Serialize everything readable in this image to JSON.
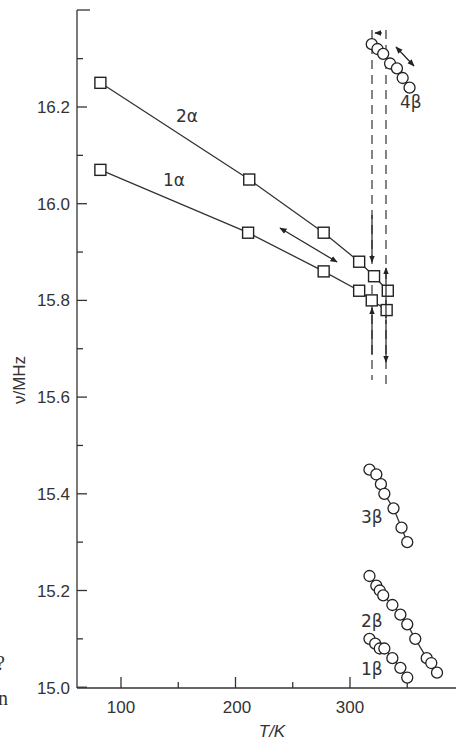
{
  "chart_data": {
    "type": "scatter",
    "title": "",
    "xlabel": "T/K",
    "ylabel": "ν/MHz",
    "xlim": [
      62,
      410
    ],
    "ylim": [
      15.0,
      16.4
    ],
    "x_ticks": [
      100,
      200,
      300
    ],
    "x_minor_ticks": [
      150,
      250,
      350
    ],
    "y_ticks": [
      15.0,
      15.2,
      15.4,
      15.6,
      15.8,
      16.0,
      16.2
    ],
    "y_tick_labels": [
      "15.0",
      "15.2",
      "15.4",
      "15.6",
      "15.8",
      "16.0",
      "16.2"
    ],
    "y_minor_ticks": [
      15.1,
      15.3,
      15.5,
      15.7,
      15.9,
      16.1,
      16.3
    ],
    "x_tick_labels": [
      "100",
      "200",
      "300"
    ],
    "grid": false,
    "legend": "inline labels",
    "series": [
      {
        "name": "2α",
        "marker": "square",
        "connected": true,
        "x": [
          82,
          212,
          277,
          308,
          321,
          333
        ],
        "y": [
          16.25,
          16.05,
          15.94,
          15.88,
          15.85,
          15.82
        ]
      },
      {
        "name": "1α",
        "marker": "square",
        "connected": true,
        "x": [
          82,
          211,
          277,
          308,
          319,
          332
        ],
        "y": [
          16.07,
          15.94,
          15.86,
          15.82,
          15.8,
          15.78
        ]
      },
      {
        "name": "4β",
        "marker": "circle",
        "connected": true,
        "x": [
          319,
          324,
          329,
          335,
          341,
          346,
          352
        ],
        "y": [
          16.33,
          16.32,
          16.31,
          16.29,
          16.28,
          16.26,
          16.24
        ]
      },
      {
        "name": "3β",
        "marker": "circle",
        "connected": true,
        "x": [
          317,
          323,
          327,
          330,
          338,
          345,
          350
        ],
        "y": [
          15.45,
          15.44,
          15.42,
          15.4,
          15.37,
          15.33,
          15.3
        ]
      },
      {
        "name": "2β",
        "marker": "circle",
        "connected": true,
        "x": [
          317,
          323,
          326,
          329,
          337,
          344,
          350,
          357,
          367,
          371,
          376
        ],
        "y": [
          15.23,
          15.21,
          15.2,
          15.19,
          15.17,
          15.15,
          15.13,
          15.1,
          15.06,
          15.05,
          15.03
        ]
      },
      {
        "name": "1β",
        "marker": "circle",
        "connected": true,
        "x": [
          317,
          322,
          326,
          330,
          337,
          344,
          350
        ],
        "y": [
          15.1,
          15.09,
          15.08,
          15.08,
          15.06,
          15.04,
          15.02
        ]
      }
    ],
    "annotations": [
      {
        "type": "dashed-vertical-line",
        "x": 321,
        "y_range": [
          15.59,
          16.36
        ]
      },
      {
        "type": "dashed-vertical-line",
        "x": 333,
        "y_range": [
          15.58,
          16.36
        ]
      },
      {
        "type": "double-arrow",
        "from": [
          248,
          15.92
        ],
        "to": [
          298,
          15.85
        ]
      },
      {
        "type": "double-arrow",
        "from": [
          333,
          16.32
        ],
        "to": [
          351,
          16.27
        ]
      },
      {
        "type": "arrow-down",
        "x": 321,
        "from": 15.93,
        "to": 15.83
      },
      {
        "type": "arrow-up",
        "x": 333,
        "from": 15.78,
        "to": 15.88
      },
      {
        "type": "arrow-up",
        "x": 321,
        "from": 15.68,
        "to": 15.79
      },
      {
        "type": "arrow-down",
        "x": 333,
        "from": 15.77,
        "to": 15.65
      },
      {
        "type": "arrow-left",
        "x": [
          322,
          326
        ],
        "y": 16.36
      }
    ]
  },
  "labels": {
    "y_axis_title": "ν/MHz",
    "x_axis_title": "T/K",
    "series_2a": "2α",
    "series_1a": "1α",
    "series_4b": "4β",
    "series_3b": "3β",
    "series_2b": "2β",
    "series_1b": "1β",
    "y_tick_0": "15.0",
    "y_tick_1": "15.2",
    "y_tick_2": "15.4",
    "y_tick_3": "15.6",
    "y_tick_4": "15.8",
    "y_tick_5": "16.0",
    "y_tick_6": "16.2",
    "x_tick_0": "100",
    "x_tick_1": "200",
    "x_tick_2": "300",
    "stray_char_1": "?",
    "stray_char_2": "n"
  }
}
